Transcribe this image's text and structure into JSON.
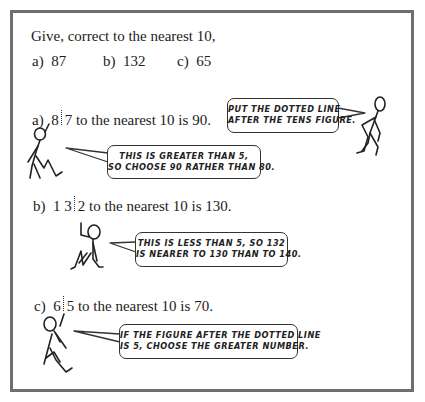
{
  "heading": "Give, correct to the nearest 10,",
  "questions": [
    {
      "label": "a)",
      "value": "87"
    },
    {
      "label": "b)",
      "value": "132"
    },
    {
      "label": "c)",
      "value": "65"
    }
  ],
  "answers": [
    {
      "label": "a)",
      "left": "8",
      "right": "7",
      "rest": "to the nearest 10 is 90."
    },
    {
      "label": "b)",
      "left": "1 3",
      "right": "2",
      "rest": "to the nearest 10 is 130."
    },
    {
      "label": "c)",
      "left": "6",
      "right": "5",
      "rest": "to the nearest 10 is 70."
    }
  ],
  "bubbles": [
    {
      "line1": "PUT THE DOTTED LINE",
      "line2": "AFTER THE TENS FIGURE."
    },
    {
      "line1": "THIS IS GREATER THAN 5,",
      "line2": "SO CHOOSE 90 RATHER THAN 80."
    },
    {
      "line1": "THIS IS LESS THAN 5, SO 132",
      "line2": "IS NEARER TO 130 THAN TO 140."
    },
    {
      "line1": "IF THE FIGURE AFTER THE DOTTED LINE",
      "line2": "IS 5, CHOOSE THE GREATER NUMBER."
    }
  ],
  "colors": {
    "border": "#6e6e6e",
    "ink": "#1c1c1c"
  }
}
